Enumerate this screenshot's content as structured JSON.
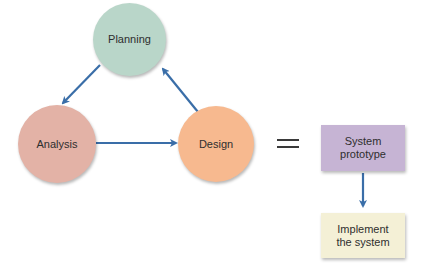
{
  "diagram": {
    "nodes": {
      "planning": {
        "label": "Planning",
        "color": "#b9d6c9"
      },
      "analysis": {
        "label": "Analysis",
        "color": "#e3b2a6"
      },
      "design": {
        "label": "Design",
        "color": "#f7b98f"
      },
      "prototype": {
        "label_line1": "System",
        "label_line2": "prototype",
        "color": "#c6b4d4"
      },
      "implement": {
        "label_line1": "Implement",
        "label_line2": "the system",
        "color": "#f4f0d6"
      }
    },
    "equals_symbol": "=",
    "edges": [
      {
        "from": "Planning",
        "to": "Analysis"
      },
      {
        "from": "Analysis",
        "to": "Design"
      },
      {
        "from": "Design",
        "to": "Planning"
      },
      {
        "from": "System prototype",
        "to": "Implement the system"
      }
    ],
    "arrow_color": "#3a6ea8"
  }
}
